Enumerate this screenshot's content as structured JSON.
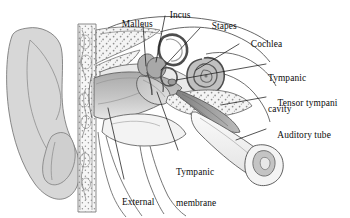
{
  "figure": {
    "type": "anatomical-illustration",
    "background_color": "#ffffff",
    "ink_color": "#222222",
    "palette": {
      "auricle_fill": "#d7d7d7",
      "bone_fill": "#efefef",
      "bone_stipple": "#9a9a9a",
      "canal_shadow": "#b9b9b9",
      "tympanic_membrane": "#c9c9c9",
      "ossicle_fill": "#b0b0b0",
      "cochlea_fill": "#b5b5b5",
      "tensor_tympani": "#8e8e8e",
      "auditory_tube_fill": "#f2f2f2",
      "cartilage_fill": "#c4c4c4",
      "outline": "#3a3a3a",
      "leader_line": "#1a1a1a"
    }
  },
  "labels": [
    {
      "id": "malleus",
      "name": "Malleus",
      "lines": [
        "Malleus"
      ],
      "x": 112,
      "y": 14,
      "align": "left",
      "leader": {
        "x1": 143,
        "y1": 25,
        "x2": 146,
        "y2": 66
      }
    },
    {
      "id": "incus",
      "name": "Incus",
      "lines": [
        "Incus"
      ],
      "x": 160,
      "y": 4,
      "align": "left",
      "leader": {
        "x1": 165,
        "y1": 16,
        "x2": 156,
        "y2": 62
      }
    },
    {
      "id": "stapes",
      "name": "Stapes",
      "lines": [
        "Stapes"
      ],
      "x": 202,
      "y": 16,
      "align": "left",
      "leader": {
        "x1": 200,
        "y1": 28,
        "x2": 161,
        "y2": 70
      }
    },
    {
      "id": "cochlea",
      "name": "Cochlea",
      "lines": [
        "Cochlea"
      ],
      "x": 241,
      "y": 34,
      "align": "left",
      "leader": {
        "x1": 239,
        "y1": 44,
        "x2": 196,
        "y2": 70
      }
    },
    {
      "id": "tympanic-cavity",
      "name": "Tympanic cavity",
      "lines": [
        "Tympanic",
        "cavity"
      ],
      "x": 268,
      "y": 57,
      "align": "left",
      "leader": {
        "x1": 266,
        "y1": 64,
        "x2": 176,
        "y2": 80
      }
    },
    {
      "id": "tensor-tympani",
      "name": "Tensor tympani",
      "lines": [
        "Tensor tympani"
      ],
      "x": 268,
      "y": 92,
      "align": "left",
      "leader": {
        "x1": 266,
        "y1": 97,
        "x2": 221,
        "y2": 105
      }
    },
    {
      "id": "auditory-tube",
      "name": "Auditory tube",
      "lines": [
        "Auditory tube"
      ],
      "x": 268,
      "y": 124,
      "align": "left",
      "leader": {
        "x1": 266,
        "y1": 129,
        "x2": 236,
        "y2": 140
      }
    },
    {
      "id": "tympanic-membrane",
      "name": "Tympanic membrane",
      "lines": [
        "Tympanic",
        "membrane"
      ],
      "x": 176,
      "y": 150,
      "align": "left",
      "leader": {
        "x1": 178,
        "y1": 150,
        "x2": 157,
        "y2": 92
      }
    },
    {
      "id": "external-acoustic-meatus",
      "name": "External acoustic meatus",
      "lines": [
        "External",
        "acoustic",
        "meatus"
      ],
      "x": 122,
      "y": 179,
      "align": "left",
      "leader": {
        "x1": 124,
        "y1": 179,
        "x2": 108,
        "y2": 108
      }
    }
  ]
}
